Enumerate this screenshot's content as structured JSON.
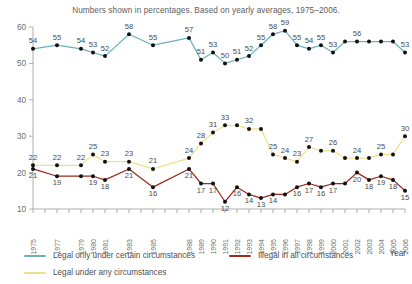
{
  "subtitle": "Numbers shown in percentages. Based on yearly averages, 1975–2006.",
  "axis": {
    "y_ticks": [
      10,
      20,
      30,
      40,
      50,
      60
    ],
    "y_min": 10,
    "y_max": 60,
    "x_axis_title": "Year"
  },
  "legend": {
    "items": [
      {
        "label": "Legal only under certain circumstances",
        "color": "#6cb2bd"
      },
      {
        "label": "Illegal in all circumstances",
        "color": "#9c2b1b"
      },
      {
        "label": "Legal under any circumstances",
        "color": "#f2df8a"
      }
    ]
  },
  "colors": {
    "teal": "#6cb2bd",
    "red": "#9c2b1b",
    "yellow": "#f2df8a",
    "marker": "#111111",
    "axis": "#9a9a9c",
    "text": "#58585a"
  },
  "chart_data": {
    "type": "line",
    "title": "",
    "subtitle": "Numbers shown in percentages. Based on yearly averages, 1975–2006.",
    "xlabel": "Year",
    "ylabel": "",
    "ylim": [
      10,
      60
    ],
    "y_ticks": [
      10,
      20,
      30,
      40,
      50,
      60
    ],
    "grid": false,
    "legend_position": "bottom-left",
    "x": [
      1975,
      1977,
      1979,
      1980,
      1981,
      1983,
      1985,
      1988,
      1989,
      1990,
      1991,
      1992,
      1993,
      1994,
      1995,
      1996,
      1997,
      1998,
      1999,
      2000,
      2001,
      2002,
      2003,
      2004,
      2005,
      2006
    ],
    "categories": [
      "1975",
      "1977",
      "1979",
      "1980",
      "1981",
      "1983",
      "1985",
      "1988",
      "1989",
      "1990",
      "1991",
      "1992",
      "1993",
      "1994",
      "1995",
      "1996",
      "1997",
      "1998",
      "1999",
      "2000",
      "2001",
      "2002",
      "2003",
      "2004",
      "2005",
      "2006"
    ],
    "series": [
      {
        "name": "Legal only under certain circumstances",
        "color": "#6cb2bd",
        "values": [
          54,
          55,
          54,
          53,
          52,
          58,
          55,
          57,
          51,
          53,
          50,
          51,
          52,
          55,
          58,
          59,
          55,
          54,
          55,
          53,
          56,
          56,
          56,
          56,
          56,
          53
        ],
        "labels": [
          54,
          55,
          54,
          53,
          52,
          58,
          55,
          57,
          51,
          53,
          50,
          51,
          52,
          55,
          58,
          59,
          55,
          54,
          55,
          53,
          null,
          56,
          null,
          null,
          null,
          53
        ]
      },
      {
        "name": "Legal under any circumstances",
        "color": "#f2df8a",
        "values": [
          22,
          22,
          22,
          25,
          23,
          23,
          21,
          24,
          28,
          31,
          33,
          33,
          32,
          32,
          25,
          24,
          23,
          27,
          26,
          26,
          24,
          24,
          24,
          25,
          25,
          30
        ],
        "labels": [
          22,
          22,
          22,
          25,
          23,
          23,
          21,
          24,
          28,
          31,
          33,
          null,
          32,
          null,
          25,
          24,
          23,
          27,
          null,
          26,
          null,
          24,
          null,
          25,
          null,
          30
        ]
      },
      {
        "name": "Illegal in all circumstances",
        "color": "#9c2b1b",
        "values": [
          21,
          19,
          19,
          19,
          18,
          21,
          16,
          21,
          17,
          17,
          12,
          16,
          14,
          13,
          14,
          14,
          16,
          17,
          16,
          17,
          17,
          20,
          18,
          19,
          18,
          15
        ],
        "labels": [
          21,
          19,
          null,
          19,
          18,
          21,
          16,
          21,
          17,
          17,
          12,
          16,
          14,
          13,
          14,
          null,
          16,
          17,
          16,
          17,
          null,
          20,
          18,
          19,
          18,
          15
        ]
      }
    ]
  }
}
